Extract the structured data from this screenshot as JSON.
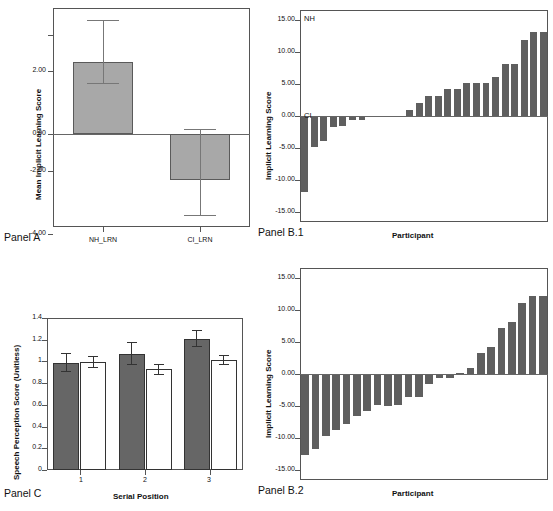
{
  "figure": {
    "panels": [
      {
        "id": "A",
        "caption": "Panel A"
      },
      {
        "id": "B.1",
        "caption": "Panel B.1"
      },
      {
        "id": "B.2",
        "caption": "Panel B.2"
      },
      {
        "id": "C",
        "caption": "Panel C"
      }
    ]
  },
  "chart_data": [
    {
      "panel": "Panel A",
      "type": "bar",
      "title": "",
      "xlabel": "",
      "ylabel": "Mean Implicit Learning Score",
      "categories": [
        "NH_LRN",
        "CI_LRN"
      ],
      "values": [
        2.3,
        -1.45
      ],
      "errors_upper": [
        3.35,
        0.15
      ],
      "errors_lower": [
        1.25,
        -3.05
      ],
      "ytick_labels": [
        "2.00",
        "0.00",
        "-2.00",
        "-4.00"
      ],
      "ytick_values": [
        2,
        0,
        -2,
        -4
      ],
      "ylim": [
        -4.6,
        4.3
      ],
      "grid": false,
      "legend": "none",
      "bar_color": "#a8a8a8",
      "error_color": "#777777"
    },
    {
      "panel": "Panel B.1",
      "type": "bar",
      "title": "",
      "xlabel": "Participant",
      "ylabel": "Implicit Learning Score",
      "annotations": [
        {
          "text": "NH",
          "position": "top-left"
        },
        {
          "text": "CI",
          "position": "zero-left"
        }
      ],
      "ytick_labels": [
        "15.00",
        "10.00",
        "5.00",
        "0.00",
        "-5.00",
        "-10.00",
        "-15.00"
      ],
      "ytick_values": [
        15,
        10,
        5,
        0,
        -5,
        -10,
        -15
      ],
      "ylim": [
        -16.5,
        16.5
      ],
      "grid": false,
      "legend": "none",
      "bar_color": "#5f5f5f",
      "values": [
        -11.9,
        -4.9,
        -3.9,
        -1.7,
        -1.6,
        -0.7,
        -0.7,
        -0.05,
        -0.05,
        -0.05,
        -0.05,
        1.0,
        2.1,
        3.1,
        3.1,
        4.2,
        4.2,
        5.1,
        5.1,
        5.1,
        6.1,
        8.1,
        8.1,
        11.9,
        13.0,
        13.0
      ]
    },
    {
      "panel": "Panel B.2",
      "type": "bar",
      "title": "",
      "xlabel": "Participant",
      "ylabel": "Implicit Learning Score",
      "ytick_labels": [
        "15.00",
        "10.00",
        "5.00",
        "0.00",
        "-5.00",
        "-10.00",
        "-15.00"
      ],
      "ytick_values": [
        15,
        10,
        5,
        0,
        -5,
        -10,
        -15
      ],
      "ylim": [
        -16.5,
        16.5
      ],
      "grid": false,
      "legend": "none",
      "bar_color": "#5f5f5f",
      "values": [
        -12.6,
        -11.6,
        -9.7,
        -8.7,
        -7.8,
        -6.5,
        -5.8,
        -4.8,
        -5.0,
        -4.8,
        -3.6,
        -3.6,
        -1.6,
        -0.6,
        -0.6,
        0.2,
        0.9,
        3.2,
        4.2,
        7.2,
        8.1,
        11.1,
        12.1,
        12.1
      ]
    },
    {
      "panel": "Panel C",
      "type": "bar",
      "title": "",
      "xlabel": "Serial Position",
      "ylabel": "Speech Perception Score (Unitless)",
      "categories": [
        "1",
        "2",
        "3"
      ],
      "ytick_labels": [
        "1.4",
        "1.2",
        "1",
        "0.8",
        "0.6",
        "0.4",
        "0.2",
        "0"
      ],
      "ytick_values": [
        1.4,
        1.2,
        1.0,
        0.8,
        0.6,
        0.4,
        0.2,
        0
      ],
      "ylim": [
        0,
        1.4
      ],
      "grid": false,
      "legend": "none",
      "series": [
        {
          "name": "filled",
          "color": "#666666",
          "values": [
            0.99,
            1.07,
            1.21
          ],
          "err_upper": [
            1.08,
            1.18,
            1.29
          ],
          "err_lower": [
            0.9,
            0.97,
            1.13
          ]
        },
        {
          "name": "open",
          "color": "#ffffff",
          "values": [
            0.995,
            0.93,
            1.015
          ],
          "err_upper": [
            1.05,
            0.98,
            1.06
          ],
          "err_lower": [
            0.94,
            0.875,
            0.965
          ]
        }
      ]
    }
  ]
}
